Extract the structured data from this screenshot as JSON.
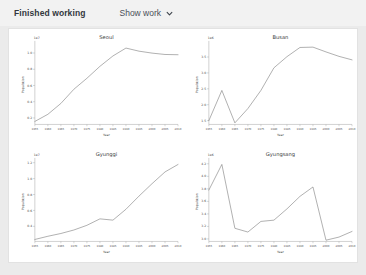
{
  "header": {
    "status_label": "Finished working",
    "show_work_label": "Show work",
    "chevron_icon": "chevron-down-icon"
  },
  "theme": {
    "page_bg": "#ebebeb",
    "header_bg": "#f2f2f2",
    "card_bg": "#ffffff",
    "card_border": "#e2e2e2",
    "line_color": "#6f6f6f",
    "axis_color": "#9a9a9a",
    "text_color": "#3b3b3b"
  },
  "chart_data": [
    {
      "type": "line",
      "title": "Seoul",
      "xlabel": "Year",
      "ylabel": "Population",
      "y_exponent": "1e7",
      "x": [
        1955,
        1960,
        1965,
        1970,
        1975,
        1980,
        1985,
        1990,
        1995,
        2000,
        2005,
        2010
      ],
      "xticklabels": [
        "1955",
        "1960",
        "1965",
        "1970",
        "1975",
        "1980",
        "1985",
        "1990",
        "1995",
        "2000",
        "2005",
        "2010"
      ],
      "values": [
        0.157,
        0.245,
        0.379,
        0.554,
        0.689,
        0.836,
        0.964,
        1.061,
        1.023,
        0.999,
        0.982,
        0.979
      ],
      "yticks": [
        0.2,
        0.4,
        0.6,
        0.8,
        1.0
      ],
      "yticklabels": [
        "0.2",
        "0.4",
        "0.6",
        "0.8",
        "1.0"
      ],
      "ylim": [
        0.12,
        1.1
      ],
      "grid": false
    },
    {
      "type": "line",
      "title": "Busan",
      "xlabel": "Year",
      "ylabel": "Population",
      "y_exponent": "1e6",
      "x": [
        1955,
        1960,
        1965,
        1970,
        1975,
        1980,
        1985,
        1990,
        1995,
        2000,
        2005,
        2010
      ],
      "xticklabels": [
        "1955",
        "1960",
        "1965",
        "1970",
        "1975",
        "1980",
        "1985",
        "1990",
        "1995",
        "2000",
        "2005",
        "2010"
      ],
      "values": [
        1.5,
        2.45,
        1.43,
        1.88,
        2.45,
        3.16,
        3.51,
        3.8,
        3.81,
        3.66,
        3.52,
        3.41
      ],
      "yticks": [
        1.5,
        2.0,
        2.5,
        3.0,
        3.5
      ],
      "yticklabels": [
        "1.5",
        "2.0",
        "2.5",
        "3.0",
        "3.5"
      ],
      "ylim": [
        1.38,
        3.88
      ],
      "grid": false
    },
    {
      "type": "line",
      "title": "Gyunggi",
      "xlabel": "Year",
      "ylabel": "Population",
      "y_exponent": "1e7",
      "x": [
        1955,
        1960,
        1965,
        1970,
        1975,
        1980,
        1985,
        1990,
        1995,
        2000,
        2005,
        2010
      ],
      "xticklabels": [
        "1955",
        "1960",
        "1965",
        "1970",
        "1975",
        "1980",
        "1985",
        "1990",
        "1995",
        "2000",
        "2005",
        "2010"
      ],
      "values": [
        0.235,
        0.275,
        0.31,
        0.354,
        0.413,
        0.494,
        0.478,
        0.615,
        0.78,
        0.936,
        1.084,
        1.178
      ],
      "yticks": [
        0.2,
        0.4,
        0.6,
        0.8,
        1.0,
        1.2
      ],
      "yticklabels": [
        "0.2",
        "0.4",
        "0.6",
        "0.8",
        "1.0",
        "1.2"
      ],
      "ylim": [
        0.21,
        1.21
      ],
      "grid": false
    },
    {
      "type": "line",
      "title": "Gyungsang",
      "xlabel": "Year",
      "ylabel": "Population",
      "y_exponent": "1e6",
      "x": [
        1955,
        1960,
        1965,
        1970,
        1975,
        1980,
        1985,
        1990,
        1995,
        2000,
        2005,
        2010
      ],
      "xticklabels": [
        "1955",
        "1960",
        "1965",
        "1970",
        "1975",
        "1980",
        "1985",
        "1990",
        "1995",
        "2000",
        "2005",
        "2010"
      ],
      "values": [
        3.78,
        4.19,
        3.17,
        3.11,
        3.28,
        3.3,
        3.48,
        3.68,
        3.83,
        2.98,
        3.03,
        3.12
      ],
      "yticks": [
        3.0,
        3.2,
        3.4,
        3.6,
        3.8,
        4.0,
        4.2
      ],
      "yticklabels": [
        "3.0",
        "3.2",
        "3.4",
        "3.6",
        "3.8",
        "4.0",
        "4.2"
      ],
      "ylim": [
        2.96,
        4.23
      ],
      "grid": false
    }
  ]
}
